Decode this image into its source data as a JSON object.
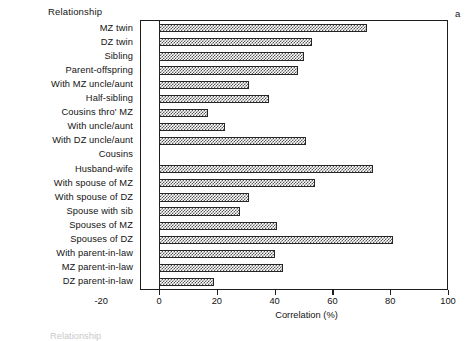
{
  "figure": {
    "panel_letter": "a",
    "category_axis_title": "Relationship",
    "footer_ghost_text": "Relationship"
  },
  "chart_data": {
    "type": "bar",
    "orientation": "horizontal",
    "title": "",
    "xlabel": "Correlation (%)",
    "ylabel": "Relationship",
    "xlim": [
      -20,
      100
    ],
    "xticks": [
      -20,
      0,
      20,
      40,
      60,
      80,
      100
    ],
    "xtick_labels": [
      "-20",
      "0",
      "20",
      "40",
      "60",
      "80",
      "100"
    ],
    "grid": false,
    "legend": null,
    "bar_fill": "checkerboard-dither-gray",
    "categories": [
      "MZ twin",
      "DZ twin",
      "Sibling",
      "Parent-offspring",
      "With MZ uncle/aunt",
      "Half-sibling",
      "Cousins thro' MZ",
      "With uncle/aunt",
      "With DZ uncle/aunt",
      "Cousins",
      "Husband-wife",
      "With spouse of MZ",
      "With spouse of DZ",
      "Spouse with sib",
      "Spouses of MZ",
      "Spouses of DZ",
      "With parent-in-law",
      "MZ parent-in-law",
      "DZ parent-in-law"
    ],
    "values": [
      72,
      53,
      50,
      48,
      31,
      38,
      17,
      23,
      51,
      0,
      74,
      54,
      31,
      28,
      41,
      81,
      40,
      43,
      19
    ]
  }
}
